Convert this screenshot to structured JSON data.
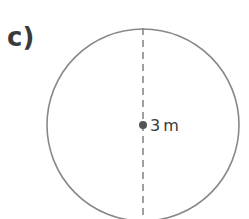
{
  "problem": {
    "label": "c)",
    "shape": "circle",
    "measurement": {
      "value": "3",
      "unit": "m",
      "text": "3 m",
      "segment": "diameter"
    }
  },
  "colors": {
    "stroke": "#888888",
    "text": "#3a3a3a",
    "center_dot": "#555555"
  }
}
